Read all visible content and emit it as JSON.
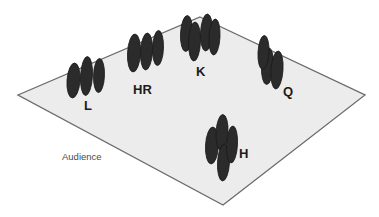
{
  "figure": {
    "title": "",
    "type": "stage-plot",
    "colors": {
      "stage_fill": "#ececec",
      "stage_outline": "#6e6a66",
      "performer_fill": "#2b2b2b",
      "performer_outline": "#1a1a1a",
      "label_color": "#1b1b1b",
      "audience_label_color": "#4a4a4a",
      "background": "#ffffff"
    }
  },
  "stage": {
    "name": "stage-parallelogram",
    "vertices": [
      {
        "x": 200,
        "y": 17
      },
      {
        "x": 365,
        "y": 95
      },
      {
        "x": 223,
        "y": 205
      },
      {
        "x": 18,
        "y": 95
      }
    ]
  },
  "audience": {
    "label": "Audience",
    "x": 62,
    "y": 160
  },
  "groups": [
    {
      "id": "L",
      "label": "L",
      "label_x": 84,
      "label_y": 110,
      "performers": [
        {
          "cx": 73.5,
          "cy": 80.5,
          "rx": 6.5,
          "ry": 17.5,
          "rot": 4
        },
        {
          "cx": 86.5,
          "cy": 76.0,
          "rx": 6.0,
          "ry": 19.5,
          "rot": 3
        },
        {
          "cx": 99.0,
          "cy": 75.5,
          "rx": 5.5,
          "ry": 17.0,
          "rot": 2
        }
      ]
    },
    {
      "id": "HR",
      "label": "HR",
      "label_x": 133,
      "label_y": 94,
      "performers": [
        {
          "cx": 134.0,
          "cy": 53.0,
          "rx": 6.5,
          "ry": 19.0,
          "rot": 3
        },
        {
          "cx": 146.5,
          "cy": 51.5,
          "rx": 6.0,
          "ry": 18.5,
          "rot": 3
        },
        {
          "cx": 158.0,
          "cy": 48.0,
          "rx": 5.5,
          "ry": 17.5,
          "rot": 2
        }
      ]
    },
    {
      "id": "K",
      "label": "K",
      "label_x": 196,
      "label_y": 76,
      "performers": [
        {
          "cx": 186.5,
          "cy": 33.5,
          "rx": 6.0,
          "ry": 18.0,
          "rot": 3
        },
        {
          "cx": 194.5,
          "cy": 41.5,
          "rx": 6.0,
          "ry": 19.5,
          "rot": 2
        },
        {
          "cx": 206.5,
          "cy": 32.5,
          "rx": 6.0,
          "ry": 18.5,
          "rot": 3
        },
        {
          "cx": 214.5,
          "cy": 37.0,
          "rx": 5.5,
          "ry": 18.0,
          "rot": 3
        }
      ]
    },
    {
      "id": "Q",
      "label": "Q",
      "label_x": 283,
      "label_y": 96,
      "performers": [
        {
          "cx": 267.5,
          "cy": 66.0,
          "rx": 6.0,
          "ry": 18.5,
          "rot": 3
        },
        {
          "cx": 263.5,
          "cy": 52.5,
          "rx": 5.5,
          "ry": 17.0,
          "rot": 3
        },
        {
          "cx": 277.0,
          "cy": 70.0,
          "rx": 6.0,
          "ry": 19.0,
          "rot": 4
        }
      ]
    },
    {
      "id": "H",
      "label": "H",
      "label_x": 239,
      "label_y": 158,
      "performers": [
        {
          "cx": 212.0,
          "cy": 145.5,
          "rx": 6.5,
          "ry": 18.5,
          "rot": 3
        },
        {
          "cx": 222.0,
          "cy": 132.5,
          "rx": 6.0,
          "ry": 18.0,
          "rot": 3
        },
        {
          "cx": 223.5,
          "cy": 162.5,
          "rx": 6.0,
          "ry": 18.5,
          "rot": 3
        },
        {
          "cx": 232.0,
          "cy": 144.5,
          "rx": 5.5,
          "ry": 18.5,
          "rot": 3
        }
      ]
    }
  ]
}
